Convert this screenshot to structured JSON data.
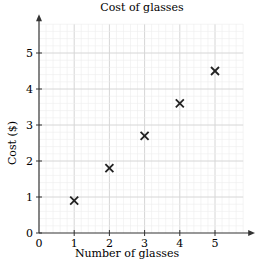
{
  "chart_data": {
    "type": "scatter",
    "title": "Cost of glasses",
    "xlabel": "Number of glasses",
    "ylabel": "Cost ($)",
    "x": [
      1,
      2,
      3,
      4,
      5
    ],
    "y": [
      0.9,
      1.8,
      2.7,
      3.6,
      4.5
    ],
    "marker": "x",
    "xlim": [
      0,
      5.8
    ],
    "ylim": [
      0,
      5.8
    ],
    "xticks": [
      "0",
      "1",
      "2",
      "3",
      "4",
      "5"
    ],
    "yticks": [
      "0",
      "1",
      "2",
      "3",
      "4",
      "5"
    ],
    "grid": true,
    "minor_grid_step": 0.2,
    "legend": null
  },
  "colors": {
    "grid_minor": "#ececec",
    "grid_major": "#d6d6d6",
    "axis": "#333333",
    "marker": "#222222"
  }
}
